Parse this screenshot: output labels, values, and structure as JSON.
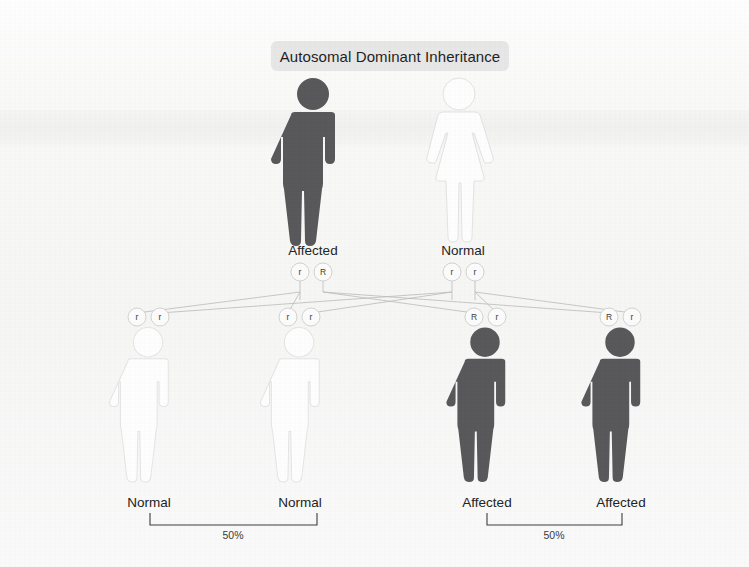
{
  "figure": {
    "title": "Autosomal Dominant Inheritance",
    "type": "pedigree-punnett-diagram",
    "colors": {
      "affected_fill": "#59595b",
      "normal_fill": "#ffffff",
      "normal_outline": "#e3e3e3",
      "title_band": "#e8e8e8",
      "line": "#b9b9b9",
      "background": "#fbfbfa",
      "text": "#232323"
    },
    "parents": [
      {
        "id": "father",
        "label": "Affected",
        "sex": "male",
        "status": "affected",
        "alleles": [
          "r",
          "R"
        ]
      },
      {
        "id": "mother",
        "label": "Normal",
        "sex": "female",
        "status": "normal",
        "alleles": [
          "r",
          "r"
        ]
      }
    ],
    "children": [
      {
        "id": "child-1",
        "label": "Normal",
        "sex": "male",
        "status": "normal",
        "alleles": [
          "r",
          "r"
        ]
      },
      {
        "id": "child-2",
        "label": "Normal",
        "sex": "male",
        "status": "normal",
        "alleles": [
          "r",
          "r"
        ]
      },
      {
        "id": "child-3",
        "label": "Affected",
        "sex": "male",
        "status": "affected",
        "alleles": [
          "R",
          "r"
        ]
      },
      {
        "id": "child-4",
        "label": "Affected",
        "sex": "male",
        "status": "affected",
        "alleles": [
          "R",
          "r"
        ]
      }
    ],
    "brackets": [
      {
        "id": "bracket-normal",
        "percent": "50%",
        "covers": [
          "child-1",
          "child-2"
        ]
      },
      {
        "id": "bracket-affected",
        "percent": "50%",
        "covers": [
          "child-3",
          "child-4"
        ]
      }
    ]
  }
}
